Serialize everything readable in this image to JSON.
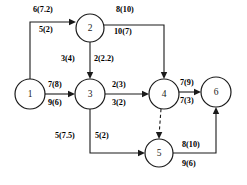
{
  "diagram": {
    "type": "directed-network-graph",
    "title": "",
    "colors": {
      "stroke": "#1a1a1a",
      "background": "#ffffff",
      "node_fill": "#ffffff"
    },
    "nodes": [
      {
        "id": "1",
        "label": "1",
        "cx": 30,
        "cy": 94,
        "r": 15
      },
      {
        "id": "2",
        "label": "2",
        "cx": 90,
        "cy": 28,
        "r": 14
      },
      {
        "id": "3",
        "label": "3",
        "cx": 90,
        "cy": 94,
        "r": 15
      },
      {
        "id": "4",
        "label": "4",
        "cx": 164,
        "cy": 94,
        "r": 15
      },
      {
        "id": "5",
        "label": "5",
        "cx": 159,
        "cy": 153,
        "r": 14
      },
      {
        "id": "6",
        "label": "6",
        "cx": 216,
        "cy": 92,
        "r": 15
      }
    ],
    "edges": [
      {
        "id": "e1-2",
        "from": "1",
        "to": "2",
        "style": "solid",
        "label_upper": "6(7.2)",
        "label_lower": "5(2)"
      },
      {
        "id": "e2-4",
        "from": "2",
        "to": "4",
        "style": "solid",
        "label_upper": "8(10)",
        "label_lower": "10(7)"
      },
      {
        "id": "e2-3",
        "from": "2",
        "to": "3",
        "style": "solid",
        "label_upper": "3(4)",
        "label_lower": "2(2.2)"
      },
      {
        "id": "e1-3",
        "from": "1",
        "to": "3",
        "style": "solid",
        "label_upper": "7(8)",
        "label_lower": "9(6)"
      },
      {
        "id": "e3-4",
        "from": "3",
        "to": "4",
        "style": "solid",
        "label_upper": "2(3)",
        "label_lower": "3(2)"
      },
      {
        "id": "e4-6",
        "from": "4",
        "to": "6",
        "style": "solid",
        "label_upper": "7(9)",
        "label_lower": "7(3)"
      },
      {
        "id": "e3-5",
        "from": "3",
        "to": "5",
        "style": "solid",
        "label_upper": "5(7.5)",
        "label_lower": "5(2)"
      },
      {
        "id": "e5-6",
        "from": "5",
        "to": "6",
        "style": "solid",
        "label_upper": "8(10)",
        "label_lower": "9(6)"
      },
      {
        "id": "e4-5",
        "from": "4",
        "to": "5",
        "style": "dashed",
        "label_upper": "",
        "label_lower": ""
      }
    ],
    "labels": {
      "n1": "1",
      "n2": "2",
      "n3": "3",
      "n4": "4",
      "n5": "5",
      "n6": "6",
      "e12_upper": "6(7.2)",
      "e12_lower": "5(2)",
      "e24_upper": "8(10)",
      "e24_lower": "10(7)",
      "e23_upper": "3(4)",
      "e23_lower": "2(2.2)",
      "e13_upper": "7(8)",
      "e13_lower": "9(6)",
      "e34_upper": "2(3)",
      "e34_lower": "3(2)",
      "e46_upper": "7(9)",
      "e46_lower": "7(3)",
      "e35_upper": "5(7.5)",
      "e35_lower": "5(2)",
      "e56_upper": "8(10)",
      "e56_lower": "9(6)"
    }
  }
}
